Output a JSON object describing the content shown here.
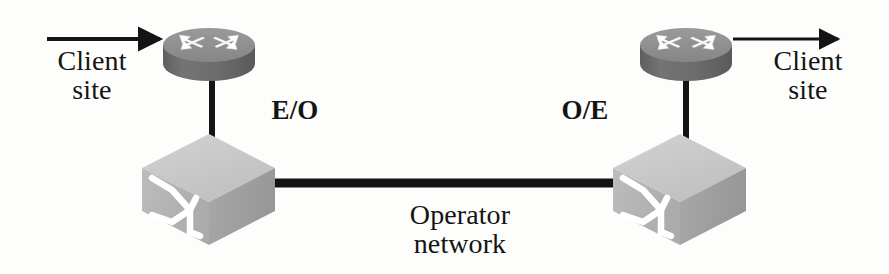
{
  "diagram": {
    "background_color": "#fdfdfc",
    "width": 889,
    "height": 274
  },
  "labels": {
    "client_site_left": "Client\nsite",
    "client_site_right": "Client\nsite",
    "eo": "E/O",
    "oe": "O/E",
    "operator_network": "Operator\nnetwork"
  },
  "nodes": [
    {
      "id": "router-left",
      "type": "router",
      "icon": "router-cylinder-icon",
      "label": "",
      "cx": 209,
      "cy": 45,
      "rx": 46,
      "ry_top": 17,
      "body_height": 37,
      "color_top": "#8e8e8e",
      "color_body": "#6f6f6f",
      "arrow_color": "#ffffff"
    },
    {
      "id": "router-right",
      "type": "router",
      "icon": "router-cylinder-icon",
      "label": "",
      "cx": 686,
      "cy": 45,
      "rx": 46,
      "ry_top": 17,
      "body_height": 37,
      "color_top": "#8e8e8e",
      "color_body": "#6f6f6f",
      "arrow_color": "#ffffff"
    },
    {
      "id": "switch-left",
      "type": "optical-switch",
      "icon": "switch-cube-icon",
      "label": "E/O",
      "x": 142,
      "y": 134,
      "width": 133,
      "height": 111,
      "color_top": "#c9c9c9",
      "color_front": "#b4b4b4",
      "color_side": "#a1a1a1",
      "symbol_color": "#ffffff"
    },
    {
      "id": "switch-right",
      "type": "optical-switch",
      "icon": "switch-cube-icon",
      "label": "O/E",
      "x": 613,
      "y": 134,
      "width": 133,
      "height": 111,
      "color_top": "#c9c9c9",
      "color_front": "#b4b4b4",
      "color_side": "#a1a1a1",
      "symbol_color": "#ffffff"
    }
  ],
  "links": [
    {
      "id": "ingress-arrow",
      "from": "client-site-left",
      "to": "router-left",
      "kind": "arrow",
      "direction": "right",
      "x1": 47,
      "y1": 39,
      "x2": 170,
      "y2": 39,
      "color": "#141414",
      "width": 4
    },
    {
      "id": "egress-arrow",
      "from": "router-right",
      "to": "client-site-right",
      "kind": "arrow",
      "direction": "right",
      "x1": 733,
      "y1": 39,
      "x2": 848,
      "y2": 39,
      "color": "#141414",
      "width": 3
    },
    {
      "id": "router-switch-left-link",
      "from": "router-left",
      "to": "switch-left",
      "kind": "line",
      "x1": 212,
      "y1": 80,
      "x2": 212,
      "y2": 152,
      "color": "#141414",
      "width": 6
    },
    {
      "id": "router-switch-right-link",
      "from": "router-right",
      "to": "switch-right",
      "kind": "line",
      "x1": 686,
      "y1": 80,
      "x2": 686,
      "y2": 152,
      "color": "#141414",
      "width": 6
    },
    {
      "id": "operator-trunk",
      "from": "switch-left",
      "to": "switch-right",
      "kind": "line",
      "label": "Operator network",
      "x1": 272,
      "y1": 183,
      "x2": 618,
      "y2": 183,
      "color": "#141414",
      "width": 9
    }
  ]
}
